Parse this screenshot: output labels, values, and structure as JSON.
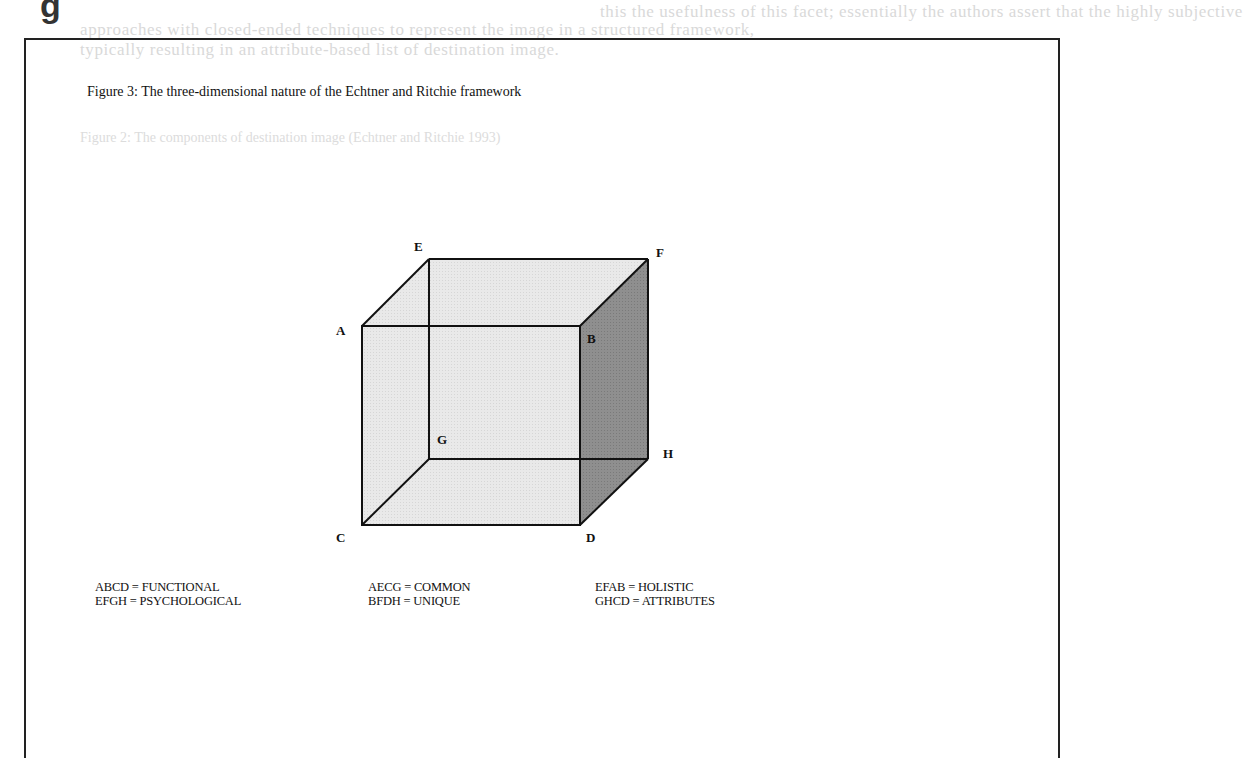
{
  "page": {
    "heading_fragment": "g",
    "bleed_through_lines": [
      "this the usefulness of this facet; essentially the authors assert that the highly subjective",
      "approaches with closed-ended techniques to represent the image in a structured framework,",
      "typically resulting in an attribute-based list of destination image."
    ],
    "bleed_through_figure_caption": "Figure 2: The components of destination image (Echtner and Ritchie 1993)"
  },
  "figure": {
    "caption": "Figure 3: The three-dimensional nature of the Echtner and Ritchie framework",
    "vertices": {
      "A": "A",
      "B": "B",
      "C": "C",
      "D": "D",
      "E": "E",
      "F": "F",
      "G": "G",
      "H": "H"
    },
    "colors": {
      "light_face": "#e6e6e6",
      "dark_face": "#8c8c8c",
      "edge": "#111111"
    },
    "legend": [
      {
        "face": "ABCD",
        "label": "ABCD = FUNCTIONAL"
      },
      {
        "face": "EFGH",
        "label": "EFGH = PSYCHOLOGICAL"
      },
      {
        "face": "AECG",
        "label": "AECG = COMMON"
      },
      {
        "face": "BFDH",
        "label": "BFDH = UNIQUE"
      },
      {
        "face": "EFAB",
        "label": "EFAB = HOLISTIC"
      },
      {
        "face": "GHCD",
        "label": "GHCD = ATTRIBUTES"
      }
    ]
  }
}
